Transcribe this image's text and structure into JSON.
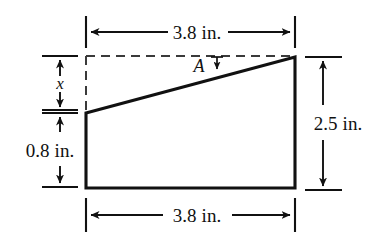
{
  "figure": {
    "shape_type": "trapezoid",
    "stroke_color": "#111111",
    "background_color": "#ffffff",
    "dimensions": {
      "top_width": {
        "label": "3.8 in.",
        "value": 3.8,
        "unit": "in.",
        "position": "top"
      },
      "bottom_width": {
        "label": "3.8 in.",
        "value": 3.8,
        "unit": "in.",
        "position": "bottom"
      },
      "right_height": {
        "label": "2.5 in.",
        "value": 2.5,
        "unit": "in.",
        "position": "right"
      },
      "left_lower_height": {
        "label": "0.8 in.",
        "value": 0.8,
        "unit": "in.",
        "position": "left-lower"
      },
      "left_upper_height": {
        "label": "x",
        "value": "x",
        "unit": "",
        "position": "left-upper"
      }
    },
    "angle": {
      "label": "A",
      "description": "angle between dashed horizontal and slanted top edge"
    }
  }
}
